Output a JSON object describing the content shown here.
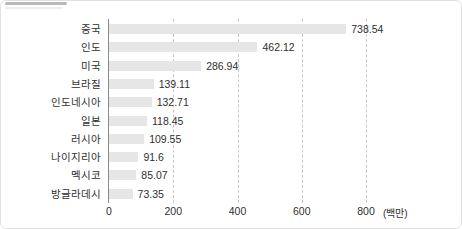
{
  "chart_data": {
    "type": "bar",
    "orientation": "horizontal",
    "title": "",
    "xlabel": "(백만)",
    "ylabel": "",
    "xlim": [
      0,
      840
    ],
    "grid": true,
    "legend": null,
    "unit_label": "(백만)",
    "xticks": [
      "0",
      "200",
      "400",
      "600",
      "800"
    ],
    "xtick_values": [
      0,
      200,
      400,
      600,
      800
    ],
    "categories": [
      "중국",
      "인도",
      "미국",
      "브라질",
      "인도네시아",
      "일본",
      "러시아",
      "나이지리아",
      "멕시코",
      "방글라데시"
    ],
    "values": [
      738.54,
      462.12,
      286.94,
      139.11,
      132.71,
      118.45,
      109.55,
      91.6,
      85.07,
      73.35
    ],
    "value_labels": [
      "738.54",
      "462.12",
      "286.94",
      "139.11",
      "132.71",
      "118.45",
      "109.55",
      "91.6",
      "85.07",
      "73.35"
    ],
    "bar_color": "#e6e6e6",
    "axis_color": "#8a8a8a",
    "grid_color": "#c8c8c8",
    "text_color": "#2f2f2f"
  }
}
